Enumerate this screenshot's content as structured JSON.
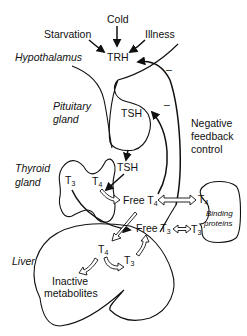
{
  "diagram": {
    "stimuli": {
      "cold": "Cold",
      "starvation": "Starvation",
      "illness": "Illness"
    },
    "organs": {
      "hypothalamus": "Hypothalamus",
      "pituitary_line1": "Pituitary",
      "pituitary_line2": "gland",
      "thyroid_line1": "Thyroid",
      "thyroid_line2": "gland",
      "liver": "Liver"
    },
    "hormones": {
      "trh": "TRH",
      "tsh_in_pituitary": "TSH",
      "tsh_released": "TSH",
      "t3_thyroid_base": "T",
      "t3_thyroid_sub": "3",
      "t4_thyroid_base": "T",
      "t4_thyroid_sub": "4",
      "free_t4_base": "Free T",
      "free_t4_sub": "4",
      "free_t3_base": "Free T",
      "free_t3_sub": "3",
      "bound_t4_base": "T",
      "bound_t4_sub": "4",
      "bound_t3_base": "T",
      "bound_t3_sub": "3",
      "liver_t4_base": "T",
      "liver_t4_sub": "4",
      "liver_t3_base": "T",
      "liver_t3_sub": "3"
    },
    "binding_proteins_line1": "Binding",
    "binding_proteins_line2": "proteins",
    "inactive_line1": "Inactive",
    "inactive_line2": "metabolites",
    "feedback_line1": "Negative",
    "feedback_line2": "feedback",
    "feedback_line3": "control",
    "feedback_sign_trh": "–",
    "feedback_sign_tsh": "–"
  }
}
